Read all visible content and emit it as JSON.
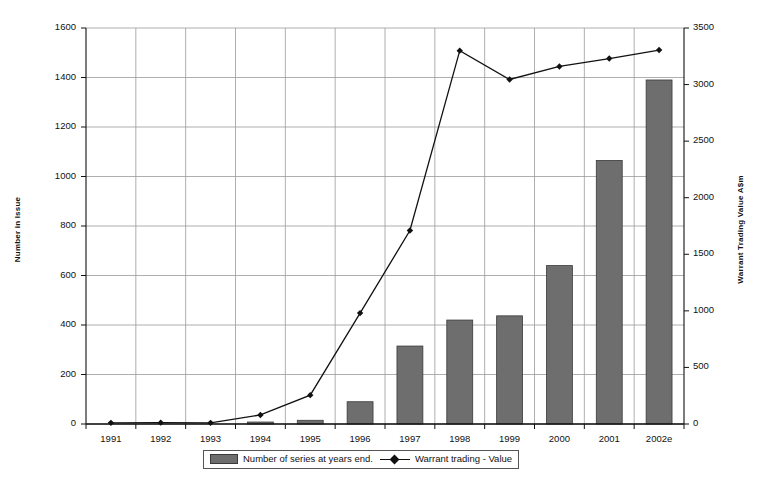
{
  "chart_data": {
    "type": "bar",
    "title": "",
    "subtitle": "",
    "xlabel": "",
    "ylabel": "Number in Issue",
    "y2label": "Warrant Trading Value A$m",
    "categories": [
      "1991",
      "1992",
      "1993",
      "1994",
      "1995",
      "1996",
      "1997",
      "1998",
      "1999",
      "2000",
      "2001",
      "2002e"
    ],
    "ylim": [
      0,
      1600
    ],
    "y2lim": [
      0,
      3500
    ],
    "yticks": [
      0,
      200,
      400,
      600,
      800,
      1000,
      1200,
      1400,
      1600
    ],
    "y2ticks": [
      0,
      500,
      1000,
      1500,
      2000,
      2500,
      3000,
      3500
    ],
    "grid": true,
    "legend_position": "bottom",
    "series": [
      {
        "name": "Number of series  at years end.",
        "type": "bar",
        "axis": "left",
        "color": "#6e6e6e",
        "values": [
          0,
          0,
          0,
          8,
          15,
          90,
          315,
          420,
          437,
          640,
          1065,
          1390
        ]
      },
      {
        "name": "Warrant trading  - Value",
        "type": "line",
        "axis": "right",
        "color": "#111111",
        "values": [
          10,
          12,
          10,
          80,
          255,
          980,
          1710,
          3300,
          3045,
          3160,
          3230,
          3305
        ]
      }
    ]
  },
  "axes": {
    "left_tick_labels": [
      "0",
      "200",
      "400",
      "600",
      "800",
      "1000",
      "1200",
      "1400",
      "1600"
    ],
    "right_tick_labels": [
      "0",
      "500",
      "1000",
      "1500",
      "2000",
      "2500",
      "3000",
      "3500"
    ],
    "x_tick_labels": [
      "1991",
      "1992",
      "1993",
      "1994",
      "1995",
      "1996",
      "1997",
      "1998",
      "1999",
      "2000",
      "2001",
      "2002e"
    ],
    "left_title": "Number in Issue",
    "right_title": "Warrant Trading Value A$m"
  },
  "legend": {
    "bars_label": "Number of series  at years end.",
    "line_label": "Warrant trading  - Value"
  },
  "colors": {
    "bar_fill": "#6e6e6e",
    "bar_edge": "#3a3a3a",
    "line": "#111111",
    "grid": "#9a9a9a",
    "axis": "#111111",
    "background": "#ffffff"
  }
}
